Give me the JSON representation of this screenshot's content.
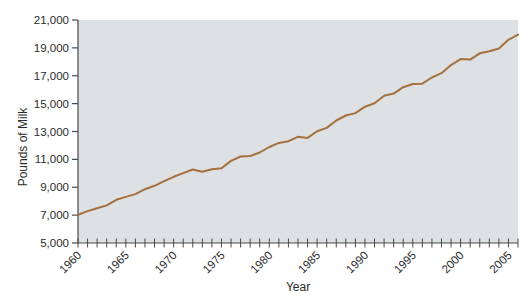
{
  "chart_data": {
    "type": "line",
    "title": "",
    "xlabel": "Year",
    "ylabel": "Pounds of Milk",
    "x": [
      1960,
      1961,
      1962,
      1963,
      1964,
      1965,
      1966,
      1967,
      1968,
      1969,
      1970,
      1971,
      1972,
      1973,
      1974,
      1975,
      1976,
      1977,
      1978,
      1979,
      1980,
      1981,
      1982,
      1983,
      1984,
      1985,
      1986,
      1987,
      1988,
      1989,
      1990,
      1991,
      1992,
      1993,
      1994,
      1995,
      1996,
      1997,
      1998,
      1999,
      2000,
      2001,
      2002,
      2003,
      2004,
      2005,
      2006
    ],
    "values": [
      7029,
      7290,
      7496,
      7700,
      8099,
      8305,
      8512,
      8857,
      9101,
      9434,
      9747,
      10015,
      10271,
      10119,
      10293,
      10360,
      10894,
      11206,
      11243,
      11492,
      11891,
      12183,
      12306,
      12622,
      12541,
      13024,
      13260,
      13786,
      14145,
      14323,
      14782,
      15031,
      15570,
      15722,
      16179,
      16405,
      16433,
      16871,
      17185,
      17763,
      18197,
      18162,
      18608,
      18760,
      18958,
      19576,
      19951
    ],
    "xlim": [
      1960,
      2006
    ],
    "ylim": [
      5000,
      21000
    ],
    "y_ticks": [
      5000,
      7000,
      9000,
      11000,
      13000,
      15000,
      17000,
      19000,
      21000
    ],
    "y_tick_labels": [
      "5,000",
      "7,000",
      "9,000",
      "11,000",
      "13,000",
      "15,000",
      "17,000",
      "19,000",
      "21,000"
    ],
    "x_major_ticks": [
      1960,
      1965,
      1970,
      1975,
      1980,
      1985,
      1990,
      1995,
      2000,
      2005
    ],
    "x_minor_tick_step": 1,
    "grid": false,
    "legend": "none",
    "line_color": "#a4713e",
    "plot_bg_color": "#dee1e3",
    "axis_color": "#4a4a4a",
    "text_color": "#2b2b2b"
  }
}
